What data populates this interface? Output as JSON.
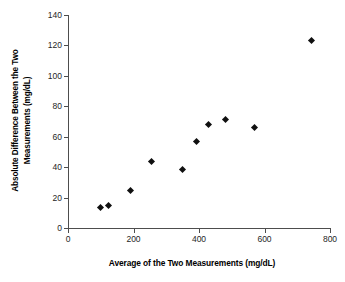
{
  "chart_data": {
    "type": "scatter",
    "title": "",
    "xlabel": "Average of the Two Measurements (mg/dL)",
    "ylabel_line1": "Absolute Difference Between the Two",
    "ylabel_line2": "Measurements (mg/dL)",
    "ylabel": "Absolute Difference Between the Two Measurements (mg/dL)",
    "xlim": [
      0,
      800
    ],
    "ylim": [
      0,
      140
    ],
    "xticks": [
      0,
      200,
      400,
      600,
      800
    ],
    "yticks": [
      0,
      20,
      40,
      60,
      80,
      100,
      120,
      140
    ],
    "xtick_labels": [
      "0",
      "200",
      "400",
      "600",
      "800"
    ],
    "ytick_labels": [
      "0",
      "20",
      "40",
      "60",
      "80",
      "100",
      "120",
      "140"
    ],
    "grid": false,
    "legend": false,
    "marker": "diamond",
    "marker_color": "#101010",
    "series": [
      {
        "name": "Measurement pairs",
        "points": [
          {
            "x": 100,
            "y": 13.5
          },
          {
            "x": 125,
            "y": 14.5
          },
          {
            "x": 190,
            "y": 24.5
          },
          {
            "x": 255,
            "y": 44.0
          },
          {
            "x": 350,
            "y": 38.5
          },
          {
            "x": 392,
            "y": 57.0
          },
          {
            "x": 430,
            "y": 68.0
          },
          {
            "x": 482,
            "y": 71.5
          },
          {
            "x": 570,
            "y": 66.0
          },
          {
            "x": 745,
            "y": 123.5
          }
        ]
      }
    ]
  }
}
